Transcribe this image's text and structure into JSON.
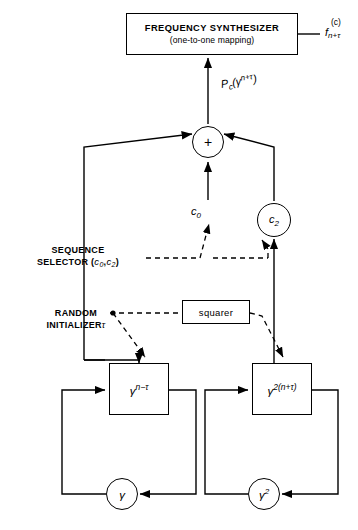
{
  "diagram": {
    "colors": {
      "line": "#000000",
      "background": "#ffffff"
    },
    "blocks": {
      "synthesizer": {
        "line1": "FREQUENCY SYNTHESIZER",
        "line2": "(one-to-one mapping)"
      },
      "squarer": {
        "label": "squarer"
      },
      "gamma_left": {
        "base": "γ",
        "exponent": "n−τ"
      },
      "gamma_right": {
        "base": "γ",
        "exponent": "2(n+τ)"
      }
    },
    "nodes": {
      "adder": {
        "symbol": "+"
      },
      "c2": {
        "base": "c",
        "subscript": "2"
      },
      "gamma_circle_left": {
        "base": "γ",
        "exponent": ""
      },
      "gamma_circle_right": {
        "base": "γ",
        "exponent": "2"
      }
    },
    "labels": {
      "output": {
        "base": "f",
        "superscript": "(c)",
        "subscript": "n+τ"
      },
      "adder_output": {
        "base": "P",
        "subscript": "c",
        "open": "(",
        "gamma": "γ",
        "exponent": "n+τ",
        "close": ")"
      },
      "c0": {
        "base": "c",
        "subscript": "0"
      },
      "sequence_selector": {
        "line1": "SEQUENCE",
        "line2_prefix": "SELECTOR (",
        "c0_base": "c",
        "c0_sub": "0",
        "comma": ",",
        "c2_base": "c",
        "c2_sub": "2",
        "line2_suffix": ")"
      },
      "random_initializer": {
        "line1": "RANDOM",
        "line2": "INITIALIZER",
        "tau": "τ"
      }
    }
  }
}
